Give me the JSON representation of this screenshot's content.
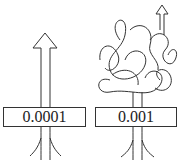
{
  "diagram": {
    "panels": [
      {
        "name": "straight-path",
        "value": "0.0001",
        "shape": "straight upward arrow"
      },
      {
        "name": "tangled-path",
        "value": "0.001",
        "shape": "tangled tree-like loops with upward arrow"
      }
    ],
    "colors": {
      "stroke": "#333333",
      "background": "#ffffff"
    }
  }
}
